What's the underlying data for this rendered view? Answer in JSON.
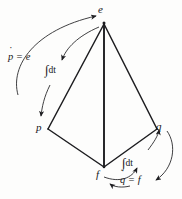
{
  "figure": {
    "name": "tetrahedron-of-state",
    "background_color": "#fdfdfc",
    "line_color": "#17171a"
  },
  "vertices": {
    "top": {
      "label": "e",
      "name": "effort",
      "x": 104,
      "y": 22
    },
    "left": {
      "label": "p",
      "name": "momentum",
      "x": 46,
      "y": 130
    },
    "right": {
      "label": "q",
      "name": "displacement",
      "x": 158,
      "y": 130
    },
    "bottom": {
      "label": "f",
      "name": "flow",
      "x": 104,
      "y": 168
    }
  },
  "annotations": {
    "p_dot_equals_e": {
      "lhs_base": "p",
      "lhs_accent": "dot",
      "relation": "=",
      "rhs": "e",
      "plain": "ṗ = e"
    },
    "q_dot_equals_f": {
      "lhs_base": "q",
      "lhs_accent": "dot",
      "relation": "=",
      "rhs": "f",
      "plain": "q̇ = f"
    },
    "integral_left": {
      "symbol": "∫",
      "differential": "dt",
      "plain": "∫dt"
    },
    "integral_right": {
      "symbol": "∫",
      "differential": "dt",
      "plain": "∫dt"
    }
  },
  "edges": [
    {
      "from": "e",
      "to": "p",
      "name": "edge-e-p"
    },
    {
      "from": "e",
      "to": "q",
      "name": "edge-e-q"
    },
    {
      "from": "e",
      "to": "f",
      "name": "edge-e-f"
    },
    {
      "from": "p",
      "to": "f",
      "name": "edge-p-f"
    },
    {
      "from": "q",
      "to": "f",
      "name": "edge-q-f"
    }
  ],
  "arrows": [
    {
      "name": "arrow-p-to-e",
      "from": "p",
      "to": "e",
      "label": "ṗ = e",
      "side": "left-outer"
    },
    {
      "name": "arrow-e-to-p",
      "from": "e",
      "to": "p",
      "label": "∫dt",
      "side": "left-inner"
    },
    {
      "name": "arrow-f-to-q",
      "from": "f",
      "to": "q",
      "label": "∫dt",
      "side": "right-inner"
    },
    {
      "name": "arrow-q-to-f",
      "from": "q",
      "to": "f",
      "label": "q̇ = f",
      "side": "right-outer"
    }
  ]
}
